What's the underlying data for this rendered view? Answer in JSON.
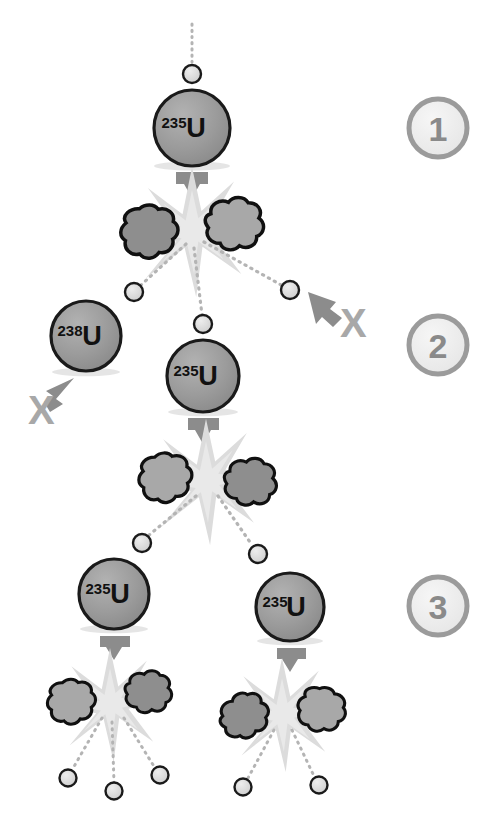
{
  "figure": {
    "background_color": "#ffffff"
  },
  "colors": {
    "nucleus_fill": "#9a9a9a",
    "nucleus_stroke": "#1a1a1a",
    "neutron_fill": "#d8d8d8",
    "neutron_stroke": "#1a1a1a",
    "fragment_dark_fill": "#8e8e8e",
    "fragment_light_fill": "#a8a8a8",
    "fragment_stroke": "#101010",
    "burst_fill": "#dcdcdc",
    "arrow_fill": "#8c8c8c",
    "trail_color": "#b0b0b0",
    "x_color": "#a8a8a8",
    "stage_ring": "#9b9b9b",
    "stage_fill": "#f0f0f0",
    "stage_text": "#8a8a8a"
  },
  "stage_markers": [
    {
      "label": "1",
      "name": "stage-marker-1"
    },
    {
      "label": "2",
      "name": "stage-marker-2"
    },
    {
      "label": "3",
      "name": "stage-marker-3"
    }
  ],
  "nuclei": [
    {
      "id": "u235-gen1",
      "mass": "235",
      "symbol": "U",
      "stage": 1
    },
    {
      "id": "u238-gen2",
      "mass": "238",
      "symbol": "U",
      "stage": 2
    },
    {
      "id": "u235-gen2",
      "mass": "235",
      "symbol": "U",
      "stage": 2
    },
    {
      "id": "u235-gen3a",
      "mass": "235",
      "symbol": "U",
      "stage": 3
    },
    {
      "id": "u235-gen3b",
      "mass": "235",
      "symbol": "U",
      "stage": 3
    }
  ],
  "x_marks": [
    {
      "id": "x-escape-right",
      "label": "X",
      "meaning": "neutron escapes without causing fission"
    },
    {
      "id": "x-absorbed-u238",
      "label": "X",
      "meaning": "neutron absorbed by U-238, no fission"
    }
  ],
  "counts": {
    "fission_events": 4,
    "neutrons_shown": 11,
    "generations": 3
  }
}
